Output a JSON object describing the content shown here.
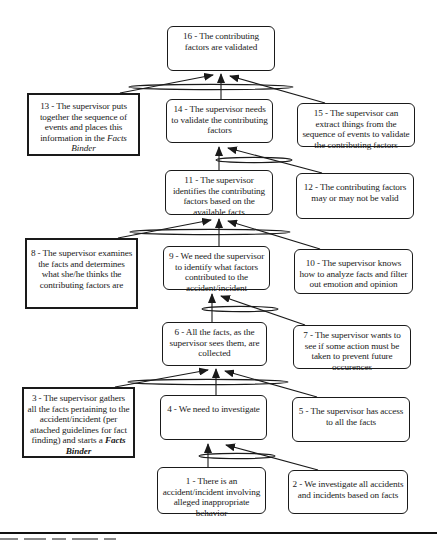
{
  "diagram": {
    "type": "goal-structure-tree",
    "nodes": [
      {
        "id": 16,
        "kind": "goal",
        "text": "16 - The contributing factors are validated",
        "box": [
          167,
          26,
          108,
          45
        ]
      },
      {
        "id": 13,
        "kind": "action",
        "text": "13 - The supervisor puts together the sequence of events and places this information in the ",
        "emph": "Facts Binder",
        "box": [
          27,
          93,
          113,
          63
        ]
      },
      {
        "id": 14,
        "kind": "goal",
        "text": "14 - The supervisor needs to validate the contributing factors",
        "box": [
          166,
          99,
          107,
          44
        ]
      },
      {
        "id": 15,
        "kind": "goal",
        "text": "15 - The supervisor can extract things from the sequence of events to validate the contributing factors",
        "box": [
          297,
          103,
          118,
          44
        ]
      },
      {
        "id": 11,
        "kind": "goal",
        "text": "11 - The supervisor identifies the contributing factors based on the available facts",
        "box": [
          165,
          170,
          108,
          45
        ]
      },
      {
        "id": 12,
        "kind": "goal",
        "text": "12 - The contributing factors may or may not be valid",
        "box": [
          296,
          173,
          118,
          46
        ]
      },
      {
        "id": 8,
        "kind": "action",
        "text": "8 - The supervisor examines the facts and determines what she/he thinks the contributing factors are",
        "box": [
          25,
          238,
          113,
          71
        ]
      },
      {
        "id": 9,
        "kind": "goal",
        "text": "9 - We need the supervisor to identify what factors contributed to the accident/incident",
        "box": [
          163,
          246,
          107,
          44
        ]
      },
      {
        "id": 10,
        "kind": "goal",
        "text": "10 - The supervisor knows how to analyze facts and filter out emotion and opinion",
        "box": [
          294,
          249,
          119,
          45
        ]
      },
      {
        "id": 6,
        "kind": "goal",
        "text": "6 - All the facts, as the supervisor sees them, are collected",
        "box": [
          162,
          322,
          105,
          44
        ]
      },
      {
        "id": 7,
        "kind": "goal",
        "text": "7 - The supervisor wants to see if some action must be taken to prevent future occurences",
        "box": [
          293,
          325,
          118,
          44
        ]
      },
      {
        "id": 3,
        "kind": "action",
        "text": "3 - The supervisor gathers all the facts pertaining to the accident/incident (per attached guidelines for fact finding) and starts a ",
        "emph": "Facts Binder",
        "box": [
          22,
          387,
          113,
          71
        ]
      },
      {
        "id": 4,
        "kind": "goal",
        "text": "4 - We need to investigate",
        "box": [
          160,
          395,
          107,
          45
        ]
      },
      {
        "id": 5,
        "kind": "goal",
        "text": "5 - The supervisor has access to all the facts",
        "box": [
          292,
          397,
          118,
          45
        ]
      },
      {
        "id": 1,
        "kind": "goal",
        "text": "1 - There is an accident/incident involving alleged inappropriate behavior",
        "box": [
          157,
          467,
          109,
          47
        ]
      },
      {
        "id": 2,
        "kind": "goal",
        "text": "2 - We investigate all accidents and incidents based on facts",
        "box": [
          288,
          470,
          120,
          44
        ]
      }
    ],
    "connections": [
      {
        "target": 16,
        "sources": [
          13,
          14,
          15
        ],
        "join": "and"
      },
      {
        "target": 14,
        "sources": [
          11,
          12
        ],
        "join": "and"
      },
      {
        "target": 11,
        "sources": [
          8,
          9,
          10
        ],
        "join": "and"
      },
      {
        "target": 9,
        "sources": [
          6,
          7
        ],
        "join": "and"
      },
      {
        "target": 6,
        "sources": [
          3,
          4,
          5
        ],
        "join": "and"
      },
      {
        "target": 4,
        "sources": [
          1,
          2
        ],
        "join": "and"
      }
    ],
    "legend": {
      "rounded_box": "goal / claim",
      "thick_square_box": "supervisor action (strategy)",
      "ellipse_over_arrows": "conjoined support (AND)"
    },
    "colors": {
      "stroke": "#1a1a1a",
      "background": "#ffffff"
    }
  },
  "texts": {
    "n16": "16 - The contributing factors are validated",
    "n13a": "13 - The supervisor puts together the sequence of events and places this information in the ",
    "n13b": "Facts Binder",
    "n14": "14 - The supervisor needs to validate the contributing factors",
    "n15": "15 - The supervisor can extract things from the sequence of events to validate the contributing factors",
    "n11": "11 - The supervisor identifies the contributing factors based on the available facts",
    "n12": "12 - The contributing factors may or may not be valid",
    "n8": "8 - The supervisor examines the facts and determines what she/he thinks the contributing factors are",
    "n9": "9 - We need the supervisor to identify what factors contributed to the accident/incident",
    "n10": "10 - The supervisor knows how to analyze facts and filter out emotion and opinion",
    "n6": "6 - All the facts, as the supervisor sees them, are collected",
    "n7": "7 - The supervisor wants to see if some action must be taken to prevent future occurences",
    "n3a": "3 - The supervisor gathers all the facts pertaining to the accident/incident (per attached guidelines for fact finding) and starts a ",
    "n3b": "Facts Binder",
    "n4": "4 - We need to investigate",
    "n5": "5 - The supervisor has access to all the facts",
    "n1": "1 - There is an accident/incident involving alleged inappropriate behavior",
    "n2": "2 - We investigate all accidents and incidents based on facts"
  }
}
